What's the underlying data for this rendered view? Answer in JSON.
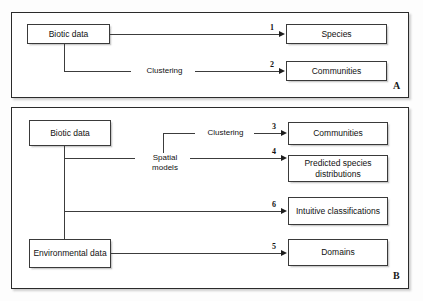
{
  "figure": {
    "background_color": "#fdfdfd",
    "line_color": "#3c3c3c",
    "box_border_color": "#3a3a3a"
  },
  "panels": [
    {
      "id": "A",
      "label": "A",
      "nodes": {
        "source": "Biotic data",
        "species": "Species",
        "communities": "Communities"
      },
      "edge_labels": {
        "clustering": "Clustering"
      },
      "numbers": {
        "species": "1",
        "communities": "2"
      }
    },
    {
      "id": "B",
      "label": "B",
      "nodes": {
        "biotic": "Biotic data",
        "environmental": "Environmental data",
        "communities": "Communities",
        "predicted": "Predicted species distributions",
        "intuitive": "Intuitive classifications",
        "domains": "Domains"
      },
      "edge_labels": {
        "clustering": "Clustering",
        "spatial_models": "Spatial models"
      },
      "numbers": {
        "communities": "3",
        "predicted": "4",
        "intuitive": "6",
        "domains": "5"
      }
    }
  ]
}
